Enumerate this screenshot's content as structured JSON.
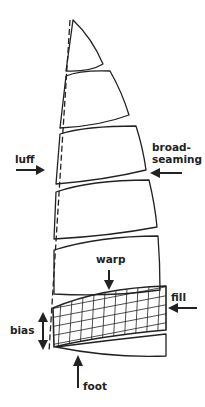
{
  "diagram": {
    "labels": {
      "luff": "luff",
      "broadseaming_line1": "broad-",
      "broadseaming_line2": "seaming",
      "warp": "warp",
      "fill": "fill",
      "bias": "bias",
      "foot": "foot"
    },
    "colors": {
      "stroke": "#222222",
      "background": "#ffffff"
    },
    "panel_count": 7
  }
}
